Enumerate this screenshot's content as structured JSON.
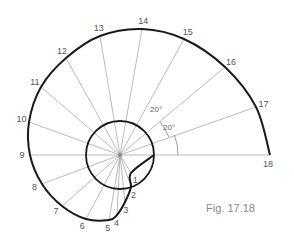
{
  "figure": {
    "caption": "Fig. 17.18",
    "center": [
      120,
      155
    ],
    "base_circle_radius": 34,
    "angle_step_deg": 20,
    "angle_labels": [
      "20°",
      "20°"
    ],
    "colors": {
      "curve": "#1a1a1a",
      "rays": "#a8a8a8",
      "labels": "#555555"
    }
  },
  "points": [
    {
      "n": "1",
      "x": 131,
      "y": 173
    },
    {
      "n": "2",
      "x": 131,
      "y": 187
    },
    {
      "n": "3",
      "x": 125,
      "y": 202
    },
    {
      "n": "4",
      "x": 117,
      "y": 215
    },
    {
      "n": "5",
      "x": 109,
      "y": 220
    },
    {
      "n": "6",
      "x": 86,
      "y": 219
    },
    {
      "n": "7",
      "x": 62,
      "y": 206
    },
    {
      "n": "8",
      "x": 42,
      "y": 184
    },
    {
      "n": "9",
      "x": 30,
      "y": 155
    },
    {
      "n": "10",
      "x": 29,
      "y": 122
    },
    {
      "n": "11",
      "x": 41,
      "y": 87
    },
    {
      "n": "12",
      "x": 66,
      "y": 58
    },
    {
      "n": "13",
      "x": 100,
      "y": 36
    },
    {
      "n": "14",
      "x": 142,
      "y": 29
    },
    {
      "n": "15",
      "x": 184,
      "y": 39
    },
    {
      "n": "16",
      "x": 225,
      "y": 67
    },
    {
      "n": "17",
      "x": 256,
      "y": 107
    },
    {
      "n": "18",
      "x": 270,
      "y": 155
    }
  ]
}
